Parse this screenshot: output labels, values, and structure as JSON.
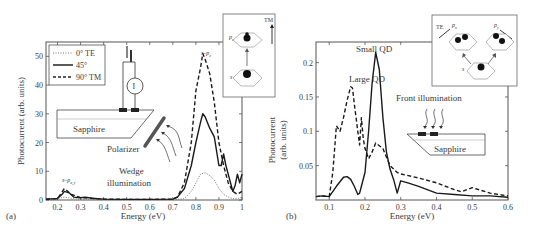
{
  "chart_data": [
    {
      "panel": "(a)",
      "type": "line",
      "title": "",
      "xlabel": "Energy (eV)",
      "ylabel": "Photocurrent (arb. units)",
      "xlim": [
        0.15,
        1.0
      ],
      "ylim": [
        0,
        55
      ],
      "xticks": [
        "0.2",
        "0.3",
        "0.4",
        "0.5",
        "0.6",
        "0.7",
        "0.8",
        "0.9",
        "1"
      ],
      "yticks": [
        "0",
        "10",
        "20",
        "30",
        "40",
        "50"
      ],
      "grid": false,
      "legend_position": "upper-left",
      "legend": [
        "0° TE",
        "45°",
        "90° TM"
      ],
      "series": [
        {
          "name": "0° TE",
          "style": "dotted",
          "x": [
            0.15,
            0.2,
            0.23,
            0.26,
            0.3,
            0.4,
            0.5,
            0.6,
            0.7,
            0.75,
            0.78,
            0.8,
            0.82,
            0.84,
            0.86,
            0.88,
            0.9,
            0.92,
            0.94,
            0.96,
            0.98,
            1.0
          ],
          "y": [
            0.3,
            0.5,
            1.0,
            0.6,
            0.3,
            0.2,
            0.1,
            0.1,
            0.1,
            0.5,
            3,
            6,
            9,
            9.5,
            8.5,
            7,
            4,
            2,
            1,
            0.5,
            0.5,
            1
          ]
        },
        {
          "name": "45°",
          "style": "solid",
          "x": [
            0.15,
            0.2,
            0.22,
            0.23,
            0.25,
            0.27,
            0.3,
            0.32,
            0.35,
            0.4,
            0.5,
            0.6,
            0.7,
            0.72,
            0.75,
            0.78,
            0.8,
            0.82,
            0.83,
            0.84,
            0.86,
            0.88,
            0.9,
            0.91,
            0.92,
            0.93,
            0.94,
            0.95,
            0.96,
            0.97,
            0.98,
            0.99,
            1.0
          ],
          "y": [
            0.3,
            0.5,
            2,
            3,
            2.5,
            1,
            0.8,
            1,
            0.6,
            0.3,
            0.2,
            0.2,
            0.3,
            1,
            4,
            12,
            20,
            27,
            30,
            29,
            25,
            22,
            12,
            12,
            16,
            12,
            9,
            6,
            3,
            5,
            9,
            6,
            9
          ]
        },
        {
          "name": "90° TM",
          "style": "dashed",
          "x": [
            0.15,
            0.2,
            0.23,
            0.26,
            0.3,
            0.4,
            0.5,
            0.6,
            0.7,
            0.72,
            0.75,
            0.78,
            0.8,
            0.82,
            0.83,
            0.84,
            0.86,
            0.88,
            0.9,
            0.92,
            0.94,
            0.96,
            0.98,
            1.0
          ],
          "y": [
            0.3,
            0.5,
            4,
            2,
            0.8,
            0.3,
            0.2,
            0.2,
            0.3,
            1,
            6,
            20,
            38,
            46,
            51,
            49,
            44,
            34,
            20,
            12,
            6,
            3,
            2,
            3
          ]
        }
      ],
      "annotations": [
        "s–p_z",
        "s–p_x,y",
        "Sapphire",
        "Polarizer",
        "Wedge illumination",
        "I"
      ],
      "inset": {
        "labels": [
          "p_z",
          "s",
          "TM"
        ]
      }
    },
    {
      "panel": "(b)",
      "type": "line",
      "title": "",
      "xlabel": "Energy (eV)",
      "ylabel": "Photocurrent (arb. units)",
      "xlim": [
        0.063,
        0.6
      ],
      "ylim": [
        0,
        0.23
      ],
      "xticks": [
        "0.1",
        "0.2",
        "0.3",
        "0.4",
        "0.5",
        "0.6"
      ],
      "yticks": [
        "0.05",
        "0.1",
        "0.15",
        "0.2"
      ],
      "grid": false,
      "series": [
        {
          "name": "Large QD",
          "style": "dashed",
          "x": [
            0.063,
            0.08,
            0.1,
            0.11,
            0.12,
            0.13,
            0.14,
            0.15,
            0.16,
            0.165,
            0.17,
            0.18,
            0.185,
            0.19,
            0.195,
            0.2,
            0.21,
            0.22,
            0.23,
            0.25,
            0.27,
            0.29,
            0.3,
            0.35,
            0.4,
            0.45,
            0.47,
            0.5,
            0.55,
            0.6
          ],
          "y": [
            0.005,
            0.006,
            0.005,
            0.04,
            0.108,
            0.1,
            0.12,
            0.145,
            0.165,
            0.163,
            0.14,
            0.1,
            0.08,
            0.12,
            0.09,
            0.075,
            0.06,
            0.07,
            0.083,
            0.075,
            0.05,
            0.04,
            0.038,
            0.032,
            0.025,
            0.015,
            0.012,
            0.018,
            0.01,
            0.006
          ]
        },
        {
          "name": "Small QD",
          "style": "solid",
          "x": [
            0.063,
            0.08,
            0.1,
            0.12,
            0.14,
            0.15,
            0.16,
            0.17,
            0.18,
            0.185,
            0.19,
            0.2,
            0.21,
            0.22,
            0.23,
            0.24,
            0.25,
            0.26,
            0.27,
            0.28,
            0.29,
            0.3,
            0.32,
            0.35,
            0.4,
            0.45,
            0.5,
            0.55,
            0.6
          ],
          "y": [
            0.005,
            0.006,
            0.005,
            0.02,
            0.033,
            0.034,
            0.03,
            0.02,
            0.008,
            0.01,
            0.02,
            0.04,
            0.1,
            0.17,
            0.215,
            0.19,
            0.12,
            0.07,
            0.045,
            0.03,
            0.01,
            0.028,
            0.025,
            0.02,
            0.01,
            0.008,
            0.006,
            0.006,
            0.004
          ]
        }
      ],
      "annotations": [
        "Large QD",
        "Small QD",
        "Front illumination",
        "Sapphire"
      ],
      "inset": {
        "labels": [
          "TE",
          "p_x",
          "p_y",
          "s"
        ]
      }
    }
  ],
  "panel_a": {
    "label": "(a)",
    "xlabel": "Energy (eV)",
    "ylabel": "Photocurrent (arb. units)",
    "legend": {
      "te": "0° TE",
      "deg45": "45°",
      "tm": "90° TM"
    },
    "annot_szp": "s–p",
    "annot_szp_sub": "z",
    "annot_sxy": "s–p",
    "annot_sxy_sub": "x,y",
    "sapphire": "Sapphire",
    "polarizer": "Polarizer",
    "wedge1": "Wedge",
    "wedge2": "illumination",
    "meter": "I",
    "inset_pz": "p",
    "inset_pz_sub": "z",
    "inset_s": "s",
    "inset_tm": "TM"
  },
  "panel_b": {
    "label": "(b)",
    "xlabel": "Energy (eV)",
    "ylabel1": "Photocurrent",
    "ylabel2": "(arb. units)",
    "large_qd": "Large QD",
    "small_qd": "Small QD",
    "front": "Front illumination",
    "sapphire": "Sapphire",
    "inset_te": "TE",
    "inset_px": "p",
    "inset_px_sub": "x",
    "inset_py": "p",
    "inset_py_sub": "y",
    "inset_s": "s"
  }
}
